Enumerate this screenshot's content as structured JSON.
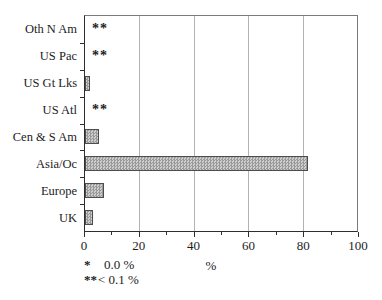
{
  "chart_data": {
    "type": "bar",
    "orientation": "horizontal",
    "title": "",
    "xlabel": "%",
    "xlim": [
      0,
      100
    ],
    "x_major_ticks": [
      0,
      20,
      40,
      60,
      80,
      100
    ],
    "x_minor_ticks": [
      10,
      30,
      50,
      70,
      90
    ],
    "gridlines": [
      20,
      40,
      60,
      80
    ],
    "grid": "vertical-major",
    "legend_position": "none",
    "categories": [
      "Oth N Am",
      "US Pac",
      "US Gt Lks",
      "US Atl",
      "Cen & S Am",
      "Asia/Oc",
      "Europe",
      "UK"
    ],
    "values": [
      0,
      0,
      2,
      0,
      5,
      82,
      7,
      3
    ],
    "markers": [
      "**",
      "**",
      "",
      "**",
      "",
      "",
      "",
      ""
    ],
    "footnotes": [
      {
        "symbol": "*",
        "text": "0.0 %"
      },
      {
        "symbol": "**",
        "text": "< 0.1 %"
      }
    ],
    "colors": {
      "background": "#ffffff",
      "text": "#1c1c1c",
      "axis": "#2e2e2e",
      "frame": "#7a7a7a",
      "gridline": "#b3b3b3",
      "bar_fill": "#cfcfcf",
      "bar_dot": "#9a9a9a",
      "bar_border": "#4d4d4d"
    }
  }
}
